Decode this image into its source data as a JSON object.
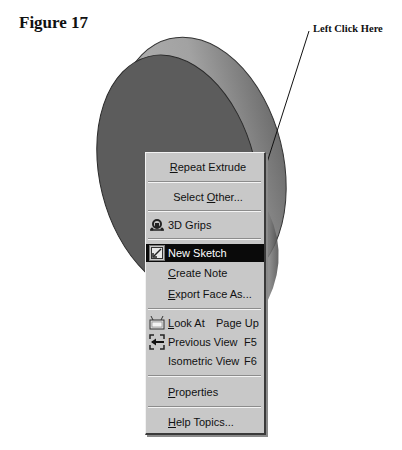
{
  "figure": {
    "title": "Figure 17",
    "callout": "Left Click Here"
  },
  "colors": {
    "disk_face": "#5c5c5c",
    "disk_rim": "#a9a9a9",
    "menu_bg": "#c8c8c8",
    "highlight_bg": "#0a0a0a",
    "highlight_text": "#ffffff"
  },
  "context_menu": {
    "items": [
      {
        "label": "Repeat Extrude",
        "mnemonic": "R",
        "icon": null
      },
      {
        "label": "Select Other...",
        "mnemonic": "O",
        "icon": null
      },
      {
        "label": "3D Grips",
        "mnemonic": null,
        "icon": "3d-grips-icon"
      },
      {
        "label": "New Sketch",
        "mnemonic": null,
        "icon": "new-sketch-icon",
        "highlighted": true
      },
      {
        "label": "Create Note",
        "mnemonic": "C",
        "icon": null
      },
      {
        "label": "Export Face As...",
        "mnemonic": "E",
        "icon": null
      },
      {
        "label": "Look At",
        "mnemonic": "L",
        "shortcut": "Page Up",
        "icon": "look-at-icon"
      },
      {
        "label": "Previous View",
        "mnemonic": null,
        "shortcut": "F5",
        "icon": "previous-view-icon"
      },
      {
        "label": "Isometric View",
        "mnemonic": null,
        "shortcut": "F6",
        "icon": null
      },
      {
        "label": "Properties",
        "mnemonic": "P",
        "icon": null
      },
      {
        "label": "Help Topics...",
        "mnemonic": "H",
        "icon": null
      }
    ],
    "text": {
      "repeat_extrude_u": "R",
      "repeat_extrude_rest": "epeat Extrude",
      "select_other_a": "Select ",
      "select_other_u": "O",
      "select_other_b": "ther...",
      "grips": "3D Grips",
      "new_sketch": "New Sketch",
      "create_note_u": "C",
      "create_note_rest": "reate Note",
      "export_face_u": "E",
      "export_face_rest": "xport Face As...",
      "look_at_u": "L",
      "look_at_rest": "ook At",
      "look_at_shortcut": "Page Up",
      "previous_view": "Previous View",
      "previous_view_shortcut": "F5",
      "isometric_view": "Isometric View",
      "isometric_view_shortcut": "F6",
      "properties_u": "P",
      "properties_rest": "roperties",
      "help_topics_u": "H",
      "help_topics_rest": "elp Topics..."
    }
  }
}
